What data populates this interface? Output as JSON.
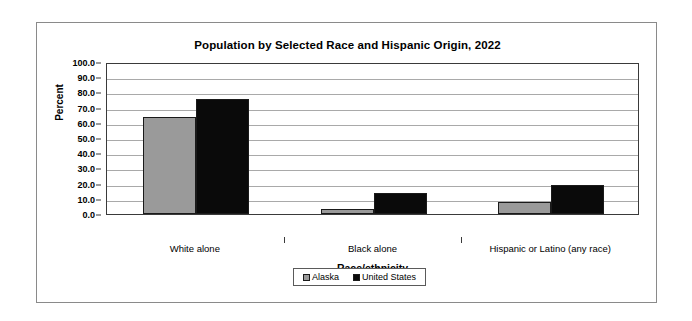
{
  "chart_data": {
    "type": "bar",
    "title": "Population by Selected Race and Hispanic Origin, 2022",
    "xlabel": "Race/ethnicity",
    "ylabel": "Percent",
    "categories": [
      "White alone",
      "Black alone",
      "Hispanic or Latino (any race)"
    ],
    "series": [
      {
        "name": "Alaska",
        "color": "#9a9a9a",
        "values": [
          63.6,
          3.2,
          7.6
        ]
      },
      {
        "name": "United States",
        "color": "#0a0a0a",
        "values": [
          75.5,
          13.6,
          19.1
        ]
      }
    ],
    "ylim": [
      0.0,
      100.0
    ],
    "ytick_step": 10.0,
    "ytick_labels": [
      "100.0",
      "90.0",
      "80.0",
      "70.0",
      "60.0",
      "50.0",
      "40.0",
      "30.0",
      "20.0",
      "10.0",
      "0.0"
    ],
    "ytick_values": [
      100.0,
      90.0,
      80.0,
      70.0,
      60.0,
      50.0,
      40.0,
      30.0,
      20.0,
      10.0,
      0.0
    ],
    "grid": true,
    "legend_position": "bottom-center"
  }
}
